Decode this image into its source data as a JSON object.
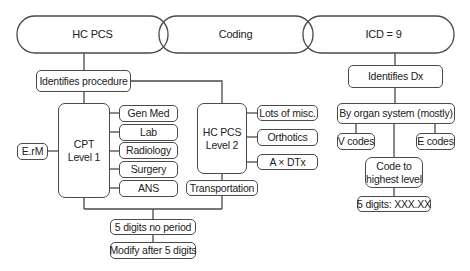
{
  "headers": {
    "left": "HC PCS",
    "middle": "Coding",
    "right": "ICD = 9"
  },
  "hcpcs": {
    "identifies": "Identifies procedure",
    "cpt": {
      "line1": "CPT",
      "line2": "Level 1"
    },
    "erm": "E.rM",
    "cpt_categories": [
      "Gen Med",
      "Lab",
      "Radiology",
      "Surgery",
      "ANS"
    ],
    "level2": {
      "line1": "HC PCS",
      "line2": "Level 2"
    },
    "level2_categories": [
      "Lots of misc.",
      "Orthotics",
      "A × DTx"
    ],
    "transportation": "Transportation",
    "five_digits": "5 digits no period",
    "modify": "Modify after 5 digits"
  },
  "icd": {
    "identifies": "Identifies Dx",
    "organ": "By organ system (mostly)",
    "v_codes": "V codes",
    "e_codes": "E codes",
    "code_highest": {
      "line1": "Code to",
      "line2": "highest level"
    },
    "five_digits": "5 digits: XXX.XX"
  },
  "colors": {
    "stroke": "#4a4a4a",
    "text": "#222222",
    "background": "#ffffff"
  }
}
